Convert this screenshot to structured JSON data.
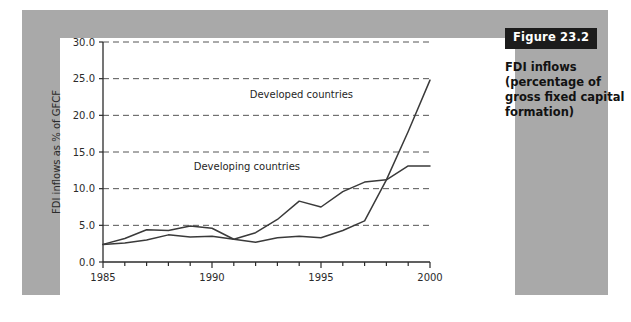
{
  "figure": {
    "badge_label": "Figure 23.2",
    "caption": "FDI inflows (percentage of gross fixed capital formation)",
    "badge_bg": "#1c1c1c",
    "badge_fg": "#ffffff",
    "frame_color": "#a9a9a9",
    "panel_color": "#ffffff"
  },
  "chart_data": {
    "type": "line",
    "title": "",
    "xlabel": "",
    "ylabel": "FDI inflows as % of GFCF",
    "xlim": [
      1985,
      2000
    ],
    "ylim": [
      0.0,
      30.0
    ],
    "grid": true,
    "grid_style": "dashed-horizontal",
    "legend": "inline-annotations",
    "yticks": [
      0.0,
      5.0,
      10.0,
      15.0,
      20.0,
      25.0,
      30.0
    ],
    "ytick_labels": [
      "0.0",
      "5.0",
      "10.0",
      "15.0",
      "20.0",
      "25.0",
      "30.0"
    ],
    "xticks": [
      1985,
      1986,
      1987,
      1988,
      1989,
      1990,
      1991,
      1992,
      1993,
      1994,
      1995,
      1996,
      1997,
      1998,
      1999,
      2000
    ],
    "xtick_labels_major": [
      "1985",
      "1990",
      "1995",
      "2000"
    ],
    "xticks_major": [
      1985,
      1990,
      1995,
      2000
    ],
    "x": [
      1985,
      1986,
      1987,
      1988,
      1989,
      1990,
      1991,
      1992,
      1993,
      1994,
      1995,
      1996,
      1997,
      1998,
      1999,
      2000
    ],
    "series": [
      {
        "name": "Developed countries",
        "color": "#3a3a3a",
        "values": [
          2.4,
          3.2,
          4.4,
          4.3,
          4.9,
          4.6,
          3.1,
          2.7,
          3.3,
          3.5,
          3.3,
          4.3,
          5.6,
          11.2,
          17.8,
          24.8
        ],
        "label_x": 1994.1,
        "label_y": 22.3
      },
      {
        "name": "Developing countries",
        "color": "#3a3a3a",
        "values": [
          2.4,
          2.6,
          3.0,
          3.7,
          3.4,
          3.5,
          3.1,
          4.0,
          5.8,
          8.3,
          7.5,
          9.6,
          10.9,
          11.2,
          13.1,
          13.1
        ],
        "label_x": 1991.6,
        "label_y": 12.6
      }
    ]
  }
}
